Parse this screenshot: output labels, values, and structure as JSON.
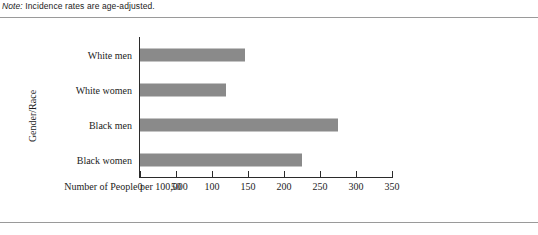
{
  "note": {
    "lead": "Note:",
    "text": " Incidence rates are age-adjusted."
  },
  "colors": {
    "bar_fill": "#8a8a8a",
    "axis": "#2b2b2b",
    "rule": "#9a9a9a",
    "text": "#1c1c1c"
  },
  "chart_data": {
    "type": "bar",
    "orientation": "horizontal",
    "title": "",
    "xlabel": "Number of People per 100,000",
    "ylabel": "Gender/Race",
    "categories": [
      "White men",
      "White women",
      "Black men",
      "Black women"
    ],
    "values": [
      146,
      119,
      275,
      225
    ],
    "xlim": [
      0,
      350
    ],
    "xticks": [
      0,
      50,
      100,
      150,
      200,
      250,
      300,
      350
    ],
    "xtick_labels": [
      "0",
      "50",
      "100",
      "150",
      "200",
      "250",
      "300",
      "350"
    ],
    "grid": false,
    "legend": false,
    "series": [
      {
        "name": "Incidence rate",
        "values": [
          146,
          119,
          275,
          225
        ]
      }
    ]
  }
}
